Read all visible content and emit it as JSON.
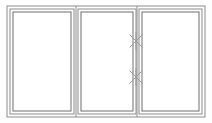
{
  "drawing": {
    "title": "Window Elevation",
    "type": "line-drawing",
    "canvas": {
      "width": 212,
      "height": 123
    },
    "background_color": "#fefefe",
    "line_color_outer": "#8c8c8c",
    "line_color_inner": "#6e6e6e",
    "line_color_mark": "#9a9a9a",
    "pane_fill": "#ffffff",
    "outer_frame": {
      "label": "Outer frame",
      "x": 7,
      "y": 6,
      "width": 198,
      "height": 111,
      "stroke_width": 1
    },
    "panels": [
      {
        "id": "panel-left",
        "label": "Left fixed pane",
        "outer": {
          "x": 10,
          "y": 9,
          "width": 64,
          "height": 105
        },
        "inner": {
          "x": 13,
          "y": 12,
          "width": 58,
          "height": 99
        }
      },
      {
        "id": "panel-center",
        "label": "Center pane",
        "outer": {
          "x": 78,
          "y": 9,
          "width": 58,
          "height": 105
        },
        "inner": {
          "x": 81,
          "y": 12,
          "width": 52,
          "height": 99
        }
      },
      {
        "id": "panel-right",
        "label": "Right pane",
        "outer": {
          "x": 139,
          "y": 9,
          "width": 63,
          "height": 105
        },
        "inner": {
          "x": 142,
          "y": 12,
          "width": 57,
          "height": 99
        }
      }
    ],
    "mullions": [
      {
        "id": "mullion-left-center",
        "label": "Mullion between left and center panes",
        "x": 76,
        "y1": 6,
        "y2": 117
      },
      {
        "id": "mullion-center-right",
        "label": "Mullion between center and right panes",
        "x": 137,
        "y1": 6,
        "y2": 117
      }
    ],
    "hinge_marks": [
      {
        "id": "hinge-mark-upper",
        "label": "Upper hinge mark",
        "symbol": "x-cross",
        "cx": 136,
        "cy": 41,
        "radius": 9
      },
      {
        "id": "hinge-mark-lower",
        "label": "Lower hinge mark",
        "symbol": "x-cross",
        "cx": 136,
        "cy": 77,
        "radius": 9
      }
    ]
  }
}
